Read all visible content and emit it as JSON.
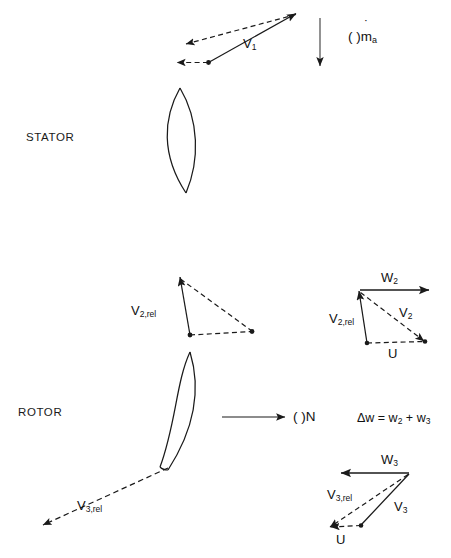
{
  "figure": {
    "stroke_color": "#1a1a1a",
    "background_color": "#ffffff"
  },
  "stages": {
    "stator_label": "STATOR",
    "rotor_label": "ROTOR"
  },
  "flow": {
    "mass_flow_label_prefix": "( )",
    "mass_flow_symbol": "m",
    "mass_flow_subscript": "a",
    "mass_flow_overdot": "˙",
    "shaft_speed_label": "( )N"
  },
  "equation": {
    "text": "Δw = w",
    "sub1": "2",
    "plus": " + w",
    "sub2": "3",
    "full": "Δw = w2 + w3"
  },
  "vectors": {
    "v1": {
      "symbol": "V",
      "sub": "1"
    },
    "v2rel_inlet": {
      "symbol": "V",
      "sub": "2,rel"
    },
    "v3rel_outlet": {
      "symbol": "V",
      "sub": "3,rel"
    },
    "w2": {
      "symbol": "W",
      "sub": "2"
    },
    "v2": {
      "symbol": "V",
      "sub": "2"
    },
    "v2rel_triangle": {
      "symbol": "V",
      "sub": "2,rel"
    },
    "u_top": {
      "symbol": "U",
      "sub": ""
    },
    "w3": {
      "symbol": "W",
      "sub": "3"
    },
    "v3": {
      "symbol": "V",
      "sub": "3"
    },
    "v3rel_triangle": {
      "symbol": "V",
      "sub": "3,rel"
    },
    "u_bottom": {
      "symbol": "U",
      "sub": ""
    }
  }
}
